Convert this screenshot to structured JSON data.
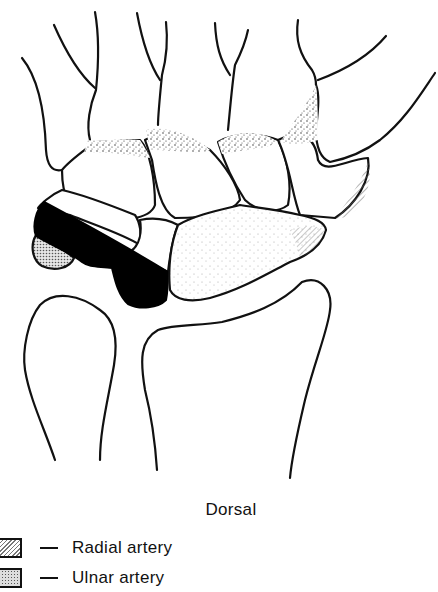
{
  "figure": {
    "title": "Dorsal",
    "view": "Dorsal view of carpal bones",
    "legend": [
      {
        "pattern": "diagonal-hatch",
        "label": "Radial artery"
      },
      {
        "pattern": "dot-screen",
        "label": "Ulnar artery"
      }
    ],
    "colors": {
      "outline": "#111111",
      "solid_fill": "#000000",
      "stipple": "#333333",
      "background": "#ffffff"
    }
  }
}
